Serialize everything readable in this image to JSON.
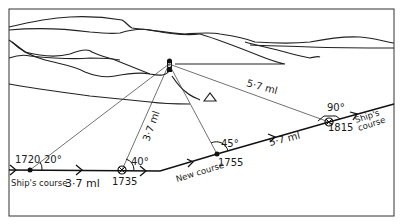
{
  "diagram": {
    "type": "navigation-bearing-fix",
    "landmark": "lighthouse",
    "positions": [
      {
        "time": "1720",
        "angle": "20°"
      },
      {
        "time": "1735",
        "angle": "40°"
      },
      {
        "time": "1755",
        "angle": "45°"
      },
      {
        "time": "1815",
        "angle": "90°"
      }
    ],
    "labels": {
      "ships_course_start": "Ship's course",
      "distance_first_leg": "3·7 ml",
      "distance_lighthouse_1735": "3·7 ml",
      "new_course": "New course",
      "distance_second_leg": "5·7 ml",
      "distance_lighthouse_1815": "5·7 ml",
      "ships_course_end_1": "Ship's",
      "ships_course_end_2": "course"
    }
  }
}
